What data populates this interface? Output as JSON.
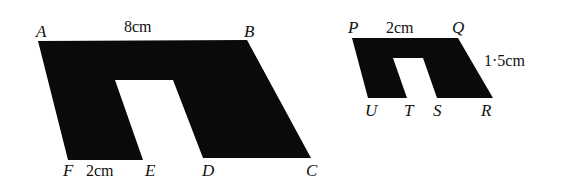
{
  "figure": {
    "large_shape": {
      "vertex_labels": {
        "A": "A",
        "B": "B",
        "C": "C",
        "D": "D",
        "E": "E",
        "F": "F"
      },
      "dimensions": {
        "top": "8cm",
        "bottom_left": "2cm"
      },
      "fill": "#0a0a0a"
    },
    "small_shape": {
      "vertex_labels": {
        "P": "P",
        "Q": "Q",
        "R": "R",
        "S": "S",
        "T": "T",
        "U": "U"
      },
      "dimensions": {
        "top": "2cm",
        "side": "1·5cm"
      },
      "fill": "#0a0a0a"
    }
  }
}
